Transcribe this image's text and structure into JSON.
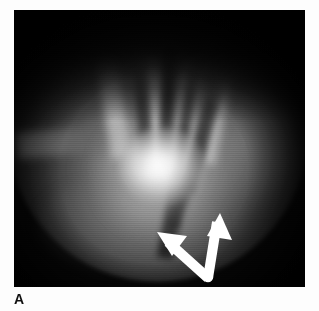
{
  "figure": {
    "panel_label": "A",
    "modality": "fluoroscopic-radiograph",
    "frame": {
      "x": 14,
      "y": 10,
      "width": 291,
      "height": 277,
      "background_color": "#060606",
      "border_color": "#000000"
    },
    "page_background": "#ffffff"
  },
  "annotation": {
    "arrow": {
      "name": "double-headed-bent-arrow",
      "color": "#ffffff",
      "stroke_width": 9,
      "vertex": {
        "x": 194,
        "y": 267
      },
      "head_left": {
        "x": 144,
        "y": 224
      },
      "head_right": {
        "x": 206,
        "y": 206
      },
      "heads": 2,
      "points_to": "bright central opacity and adjacent margin"
    }
  },
  "image_features": {
    "bright_core": {
      "cx": 149,
      "cy": 157,
      "rx": 44,
      "ry": 39,
      "intensity": "high"
    },
    "top_shadow": {
      "height": 112,
      "intensity": "very-low"
    },
    "fov_disc": {
      "cx": 144,
      "cy": 122,
      "r": 150
    },
    "bands": [
      {
        "name": "band-1",
        "angle": -9,
        "x": 98,
        "y": 38
      },
      {
        "name": "band-2",
        "angle": -3,
        "x": 128,
        "y": 26
      },
      {
        "name": "band-3",
        "angle": 5,
        "x": 160,
        "y": 44
      },
      {
        "name": "band-4",
        "angle": 11,
        "x": 186,
        "y": 62
      }
    ],
    "streaks": [
      {
        "name": "streak-1",
        "angle": -4,
        "x": 118,
        "y": 40
      },
      {
        "name": "streak-2",
        "angle": 3,
        "x": 150,
        "y": 30
      },
      {
        "name": "streak-3",
        "angle": 9,
        "x": 176,
        "y": 46
      },
      {
        "name": "streak-4",
        "angle": 16,
        "x": 199,
        "y": 66
      },
      {
        "name": "streak-5",
        "angle": 10,
        "x": 160,
        "y": 150
      },
      {
        "name": "streak-6",
        "angle": 18,
        "x": 182,
        "y": 128
      }
    ]
  }
}
